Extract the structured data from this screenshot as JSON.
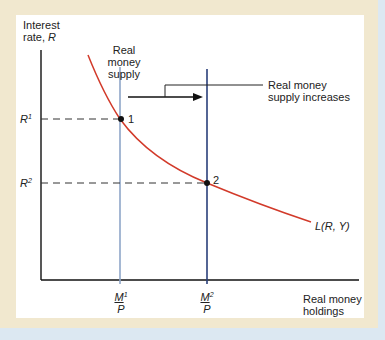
{
  "diagram": {
    "y_axis_label_line1": "Interest",
    "y_axis_label_line2": "rate, ",
    "y_axis_symbol": "R",
    "x_axis_label_line1": "Real money",
    "x_axis_label_line2": "holdings",
    "supply_label_line1": "Real money",
    "supply_label_line2": "supply",
    "shift_label_line1": "Real money",
    "shift_label_line2": "supply increases",
    "curve_label": "L(R, Y)",
    "r1": {
      "base": "R",
      "sup": "1"
    },
    "r2": {
      "base": "R",
      "sup": "2"
    },
    "m1": {
      "num": "M",
      "sup": "1",
      "den": "P"
    },
    "m2": {
      "num": "M",
      "sup": "2",
      "den": "P"
    },
    "point1_label": "1",
    "point2_label": "2",
    "colors": {
      "curve": "#d23a2a",
      "supply1": "#8fa6c8",
      "supply2": "#2a3f7a",
      "axis": "#111111",
      "frame": "#f1e8cf",
      "background": "#dce8f2"
    }
  }
}
